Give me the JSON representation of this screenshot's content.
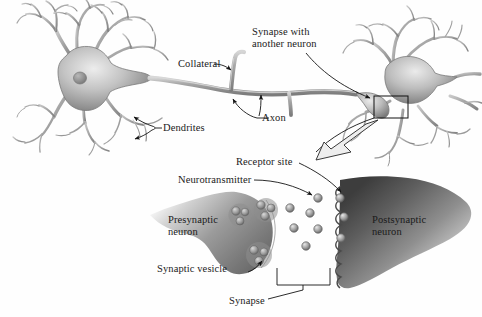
{
  "figure": {
    "background_color": "#fefefe",
    "ink_color": "#1a1a1a",
    "neuron_fill_light": "#e8e8e8",
    "neuron_fill_mid": "#9a9a9a",
    "neuron_fill_dark": "#5a5a5a",
    "neuron_outline": "#6f6f6f"
  },
  "upper_panel": {
    "name": "two-neuron-overview",
    "labels": {
      "collateral": "Collateral",
      "synapse_with_another_neuron_line1": "Synapse with",
      "synapse_with_another_neuron_line2": "another neuron",
      "axon": "Axon",
      "dendrites": "Dendrites"
    },
    "inset_box": {
      "label": "magnified-synapse-region",
      "x": 374,
      "y": 96,
      "width": 34,
      "height": 22
    }
  },
  "lower_panel": {
    "name": "synapse-detail",
    "labels": {
      "receptor_site": "Receptor site",
      "neurotransmitter": "Neurotransmitter",
      "presynaptic_neuron_line1": "Presynaptic",
      "presynaptic_neuron_line2": "neuron",
      "postsynaptic_neuron_line1": "Postsynaptic",
      "postsynaptic_neuron_line2": "neuron",
      "synaptic_vesicle": "Synaptic vesicle",
      "synapse": "Synapse"
    },
    "vesicle_clusters": [
      {
        "cx": 240,
        "cy": 215,
        "r": 11,
        "dots": 3
      },
      {
        "cx": 266,
        "cy": 211,
        "r": 12,
        "dots": 3
      },
      {
        "cx": 259,
        "cy": 255,
        "r": 13,
        "dots": 3
      }
    ],
    "neurotransmitter_dots": [
      {
        "cx": 318,
        "cy": 198
      },
      {
        "cx": 340,
        "cy": 198
      },
      {
        "cx": 344,
        "cy": 217
      },
      {
        "cx": 310,
        "cy": 213
      },
      {
        "cx": 294,
        "cy": 228
      },
      {
        "cx": 318,
        "cy": 229
      },
      {
        "cx": 341,
        "cy": 238
      },
      {
        "cx": 306,
        "cy": 246
      },
      {
        "cx": 290,
        "cy": 208
      }
    ],
    "receptor_pocket_count": 9
  }
}
